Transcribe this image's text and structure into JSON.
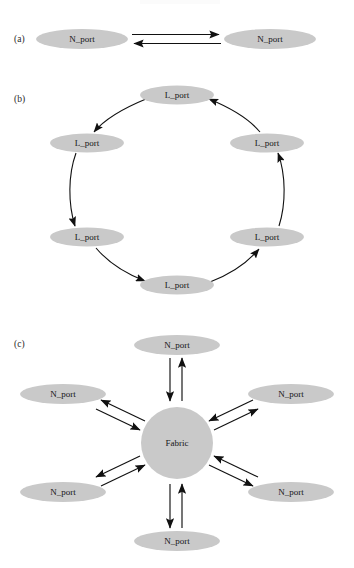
{
  "figure": {
    "background_color": "#ffffff",
    "node_fill_color": "#c9c9c9",
    "edge_color": "#111111"
  },
  "panels": [
    {
      "id": "a",
      "label": "(a)",
      "topology": "point-to-point",
      "nodes": [
        {
          "label": "N_port",
          "cx": 82,
          "cy": 39,
          "rx": 46,
          "ry": 10
        },
        {
          "label": "N_port",
          "cx": 270,
          "cy": 39,
          "rx": 46,
          "ry": 10
        }
      ],
      "arrows": [
        {
          "from": "left",
          "to": "right",
          "direction": "right"
        },
        {
          "from": "right",
          "to": "left",
          "direction": "left"
        }
      ]
    },
    {
      "id": "b",
      "label": "(b)",
      "topology": "arbitrated-loop",
      "nodes": [
        {
          "label": "L_port",
          "cx": 177,
          "cy": 95,
          "rx": 37,
          "ry": 9.5,
          "position": "top"
        },
        {
          "label": "L_port",
          "cx": 87,
          "cy": 143,
          "rx": 37,
          "ry": 9.5,
          "position": "upper-left"
        },
        {
          "label": "L_port",
          "cx": 87,
          "cy": 237,
          "rx": 37,
          "ry": 9.5,
          "position": "lower-left"
        },
        {
          "label": "L_port",
          "cx": 177,
          "cy": 285,
          "rx": 37,
          "ry": 9.5,
          "position": "bottom"
        },
        {
          "label": "L_port",
          "cx": 267,
          "cy": 237,
          "rx": 37,
          "ry": 9.5,
          "position": "lower-right"
        },
        {
          "label": "L_port",
          "cx": 267,
          "cy": 143,
          "rx": 37,
          "ry": 9.5,
          "position": "upper-right"
        }
      ],
      "loop_direction": "counter-clockwise"
    },
    {
      "id": "c",
      "label": "(c)",
      "topology": "switched-fabric",
      "hub": {
        "label": "Fabric",
        "cx": 177,
        "cy": 443,
        "r": 36
      },
      "nodes": [
        {
          "label": "N_port",
          "cx": 177,
          "cy": 345,
          "rx": 43,
          "ry": 10,
          "position": "top"
        },
        {
          "label": "N_port",
          "cx": 63,
          "cy": 394,
          "rx": 43,
          "ry": 10,
          "position": "upper-left"
        },
        {
          "label": "N_port",
          "cx": 63,
          "cy": 492,
          "rx": 43,
          "ry": 10,
          "position": "lower-left"
        },
        {
          "label": "N_port",
          "cx": 177,
          "cy": 541,
          "rx": 43,
          "ry": 10,
          "position": "bottom"
        },
        {
          "label": "N_port",
          "cx": 291,
          "cy": 492,
          "rx": 43,
          "ry": 10,
          "position": "lower-right"
        },
        {
          "label": "N_port",
          "cx": 291,
          "cy": 394,
          "rx": 43,
          "ry": 10,
          "position": "upper-right"
        }
      ],
      "link_type": "bidirectional-pair"
    }
  ]
}
